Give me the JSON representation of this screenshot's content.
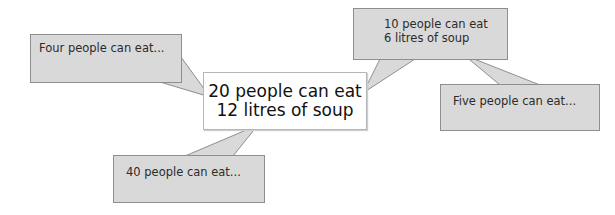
{
  "colors": {
    "bubble_fill": "#d9d9d9",
    "bubble_border": "#8e8e8e",
    "center_fill": "#ffffff",
    "text": "#2b2b2b"
  },
  "center": {
    "lines": [
      "20 people can eat",
      "12 litres of soup"
    ]
  },
  "bubbles": [
    {
      "id": "four",
      "lines": [
        "Four people can eat..."
      ]
    },
    {
      "id": "ten",
      "lines": [
        "10 people can eat",
        "6 litres of soup"
      ]
    },
    {
      "id": "five",
      "lines": [
        "Five people can eat..."
      ]
    },
    {
      "id": "forty",
      "lines": [
        "40 people can eat..."
      ]
    }
  ]
}
